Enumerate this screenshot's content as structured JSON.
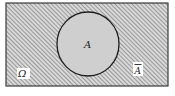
{
  "diagram": {
    "type": "venn",
    "universe": {
      "label": "Ω",
      "fill_pattern": "diagonal-hatch",
      "hatch_color": "#8a8a8a",
      "background": "#d8d8d8",
      "border_color": "#3a3a3a"
    },
    "set_a": {
      "label": "A",
      "fill": "#cfcfcf",
      "border_color": "#1e1e1e"
    },
    "complement": {
      "label": "Ā",
      "base": "A"
    }
  }
}
